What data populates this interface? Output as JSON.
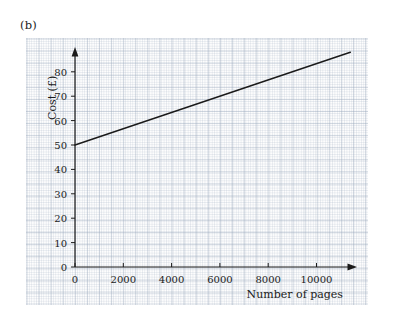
{
  "figure": {
    "part_label": "(b)"
  },
  "chart_data": {
    "type": "line",
    "title": "",
    "xlabel": "Number of pages",
    "ylabel": "Cost (£)",
    "xlim": [
      0,
      11400
    ],
    "ylim": [
      0,
      88
    ],
    "grid": true,
    "grid_style": "graph-paper",
    "legend": "none",
    "x_ticks": [
      0,
      2000,
      4000,
      6000,
      8000,
      10000
    ],
    "x_tick_labels": [
      "0",
      "2000",
      "4000",
      "6000",
      "8000",
      "10000"
    ],
    "y_ticks": [
      0,
      10,
      20,
      30,
      40,
      50,
      60,
      70,
      80
    ],
    "y_tick_labels": [
      "0",
      "10",
      "20",
      "30",
      "40",
      "50",
      "60",
      "70",
      "80"
    ],
    "series": [
      {
        "name": "Cost",
        "x": [
          0,
          11400
        ],
        "values": [
          50,
          88
        ],
        "intercept": 50,
        "slope_per_page": 0.003333,
        "color": "#1a1a1a"
      }
    ],
    "axis_arrows": true,
    "axis_color": "#1a1a1a"
  },
  "colors": {
    "background": "#ffffff",
    "panel": "#fdfdfd",
    "grid_minor": "#a0afc3",
    "grid_major": "#96a5b9",
    "axis": "#1a1a1a",
    "line": "#1a1a1a",
    "text": "#1b1b1b"
  }
}
